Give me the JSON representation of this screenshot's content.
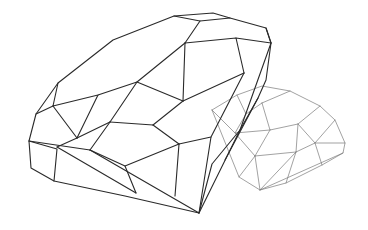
{
  "scene": {
    "description": "Line drawing of two faceted diamonds on white background",
    "background": "#ffffff",
    "width": 368,
    "height": 230
  },
  "big_diamond": {
    "color": "#2a2a2a",
    "outline": [
      [
        29,
        141
      ],
      [
        36,
        114
      ],
      [
        58,
        83
      ],
      [
        113,
        40
      ],
      [
        174,
        16
      ],
      [
        213,
        13
      ],
      [
        230,
        18
      ],
      [
        266,
        28
      ],
      [
        271,
        43
      ],
      [
        266,
        80
      ],
      [
        258,
        98
      ],
      [
        240,
        130
      ],
      [
        212,
        164
      ],
      [
        199,
        213
      ],
      [
        125,
        196
      ],
      [
        54,
        181
      ],
      [
        31,
        168
      ],
      [
        29,
        141
      ]
    ],
    "edges": [
      [
        [
          174,
          16
        ],
        [
          200,
          21
        ],
        [
          230,
          18
        ]
      ],
      [
        [
          200,
          21
        ],
        [
          185,
          43
        ]
      ],
      [
        [
          266,
          28
        ],
        [
          271,
          43
        ]
      ],
      [
        [
          185,
          43
        ],
        [
          236,
          38
        ],
        [
          271,
          43
        ]
      ],
      [
        [
          185,
          43
        ],
        [
          137,
          82
        ],
        [
          98,
          95
        ],
        [
          53,
          106
        ],
        [
          58,
          83
        ]
      ],
      [
        [
          53,
          106
        ],
        [
          36,
          114
        ]
      ],
      [
        [
          185,
          43
        ],
        [
          183,
          101
        ]
      ],
      [
        [
          236,
          38
        ],
        [
          244,
          73
        ]
      ],
      [
        [
          183,
          101
        ],
        [
          244,
          73
        ]
      ],
      [
        [
          137,
          82
        ],
        [
          183,
          101
        ]
      ],
      [
        [
          98,
          95
        ],
        [
          77,
          138
        ]
      ],
      [
        [
          77,
          138
        ],
        [
          53,
          106
        ]
      ],
      [
        [
          77,
          138
        ],
        [
          57,
          147
        ]
      ],
      [
        [
          183,
          101
        ],
        [
          153,
          125
        ]
      ],
      [
        [
          137,
          82
        ],
        [
          110,
          122
        ]
      ],
      [
        [
          110,
          122
        ],
        [
          153,
          125
        ]
      ],
      [
        [
          110,
          122
        ],
        [
          77,
          138
        ]
      ],
      [
        [
          153,
          125
        ],
        [
          179,
          144
        ]
      ],
      [
        [
          179,
          144
        ],
        [
          211,
          137
        ],
        [
          244,
          73
        ]
      ],
      [
        [
          110,
          122
        ],
        [
          90,
          150
        ]
      ],
      [
        [
          90,
          150
        ],
        [
          125,
          166
        ],
        [
          179,
          144
        ]
      ],
      [
        [
          29,
          141
        ],
        [
          90,
          150
        ]
      ],
      [
        [
          29,
          141
        ],
        [
          57,
          149
        ],
        [
          54,
          181
        ]
      ],
      [
        [
          125,
          166
        ],
        [
          136,
          193
        ]
      ],
      [
        [
          57,
          147
        ],
        [
          136,
          193
        ]
      ],
      [
        [
          90,
          150
        ],
        [
          199,
          213
        ]
      ],
      [
        [
          179,
          144
        ],
        [
          175,
          196
        ]
      ],
      [
        [
          211,
          137
        ],
        [
          199,
          213
        ]
      ],
      [
        [
          240,
          130
        ],
        [
          199,
          213
        ]
      ],
      [
        [
          258,
          98
        ],
        [
          225,
          160
        ]
      ],
      [
        [
          271,
          43
        ],
        [
          240,
          130
        ]
      ]
    ]
  },
  "small_diamond": {
    "color": "#7a7a7a",
    "outline": [
      [
        212,
        110
      ],
      [
        237,
        95
      ],
      [
        262,
        86
      ],
      [
        290,
        91
      ],
      [
        320,
        106
      ],
      [
        335,
        120
      ],
      [
        345,
        143
      ],
      [
        343,
        153
      ],
      [
        322,
        165
      ],
      [
        286,
        183
      ],
      [
        260,
        190
      ],
      [
        239,
        177
      ],
      [
        212,
        110
      ]
    ],
    "edges": [
      [
        [
          237,
          95
        ],
        [
          246,
          114
        ],
        [
          262,
          103
        ]
      ],
      [
        [
          262,
          103
        ],
        [
          290,
          91
        ]
      ],
      [
        [
          262,
          103
        ],
        [
          270,
          130
        ],
        [
          298,
          124
        ],
        [
          320,
          106
        ]
      ],
      [
        [
          246,
          114
        ],
        [
          235,
          133
        ],
        [
          270,
          130
        ]
      ],
      [
        [
          298,
          124
        ],
        [
          315,
          143
        ],
        [
          345,
          143
        ]
      ],
      [
        [
          298,
          124
        ],
        [
          296,
          152
        ]
      ],
      [
        [
          270,
          130
        ],
        [
          255,
          156
        ]
      ],
      [
        [
          255,
          156
        ],
        [
          296,
          152
        ],
        [
          315,
          143
        ]
      ],
      [
        [
          335,
          120
        ],
        [
          315,
          143
        ]
      ],
      [
        [
          235,
          133
        ],
        [
          255,
          156
        ]
      ],
      [
        [
          212,
          110
        ],
        [
          235,
          133
        ]
      ],
      [
        [
          255,
          156
        ],
        [
          260,
          190
        ]
      ],
      [
        [
          296,
          152
        ],
        [
          286,
          183
        ]
      ],
      [
        [
          315,
          143
        ],
        [
          322,
          165
        ]
      ],
      [
        [
          255,
          156
        ],
        [
          239,
          177
        ]
      ],
      [
        [
          296,
          152
        ],
        [
          260,
          190
        ]
      ],
      [
        [
          343,
          153
        ],
        [
          260,
          190
        ]
      ]
    ]
  }
}
